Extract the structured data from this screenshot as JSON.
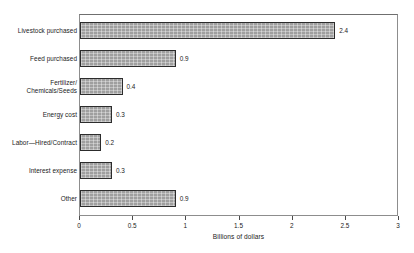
{
  "top_strip_text": "",
  "chart_data": {
    "type": "bar",
    "orientation": "horizontal",
    "title": "",
    "subtitle": "",
    "xlabel": "Billions of dollars",
    "ylabel": "",
    "xlim": [
      0,
      3
    ],
    "grid": false,
    "legend": null,
    "xticks": [
      "0",
      "0.5",
      "1",
      "1.5",
      "2",
      "2.5",
      "3"
    ],
    "xtick_values": [
      0,
      0.5,
      1,
      1.5,
      2,
      2.5,
      3
    ],
    "categories": [
      "Livestock purchased",
      "Feed purchased",
      "Fertilizer/\nChemicals/Seeds",
      "Energy cost",
      "Labor—Hired/Contract",
      "Interest expense",
      "Other"
    ],
    "values": [
      2.4,
      0.9,
      0.4,
      0.3,
      0.2,
      0.3,
      0.9
    ],
    "value_labels": [
      "2.4",
      "0.9",
      "0.4",
      "0.3",
      "0.2",
      "0.3",
      "0.9"
    ],
    "bar_fill_color": "#a9a9a9",
    "bar_edge_color": "#2c2c2c",
    "axis_color": "#8d8d8d",
    "text_color": "#1b1b1b"
  }
}
